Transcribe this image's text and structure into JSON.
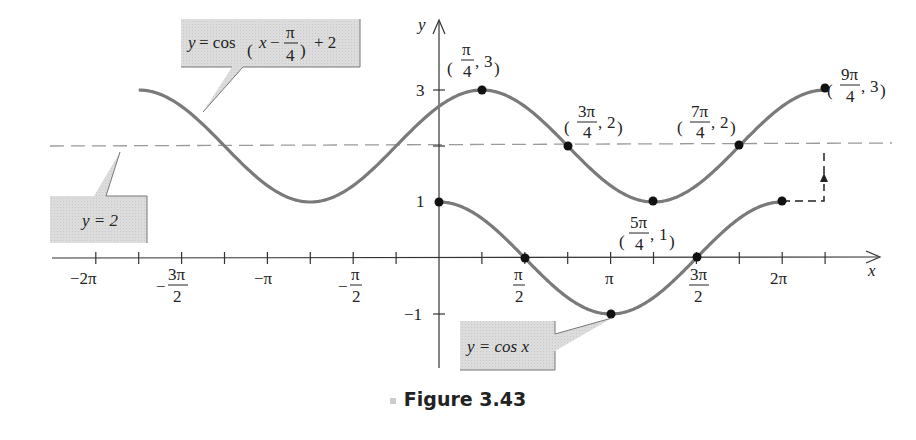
{
  "figure": {
    "caption": "Figure 3.43"
  },
  "chart_data": {
    "type": "line",
    "title": "",
    "xlabel": "x",
    "ylabel": "y",
    "xlim": [
      -6.6,
      8.4
    ],
    "ylim": [
      -1.9,
      3.6
    ],
    "grid": false,
    "x_ticks": [
      "-2π",
      "-3π/2",
      "-π",
      "-π/2",
      "π/2",
      "π",
      "3π/2",
      "2π"
    ],
    "x_tick_values": [
      -6.2832,
      -4.7124,
      -3.1416,
      -1.5708,
      1.5708,
      3.1416,
      4.7124,
      6.2832
    ],
    "x_minor_tick_step": "π/4",
    "y_ticks": [
      "-1",
      "1",
      "3"
    ],
    "y_tick_values": [
      -1,
      1,
      3
    ],
    "series": [
      {
        "name": "y = cos x",
        "function": "cos(x)",
        "domain": [
          0,
          6.2832
        ],
        "points": [
          {
            "x": 0,
            "y": 1
          },
          {
            "x": 1.5708,
            "y": 0
          },
          {
            "x": 3.1416,
            "y": -1
          },
          {
            "x": 4.7124,
            "y": 0
          },
          {
            "x": 6.2832,
            "y": 1
          }
        ]
      },
      {
        "name": "y = cos(x − π/4) + 2",
        "function": "cos(x - pi/4) + 2",
        "domain": [
          -5.4978,
          7.0686
        ],
        "points": [
          {
            "x": 0.7854,
            "y": 3,
            "label": "(π/4, 3)"
          },
          {
            "x": 2.3562,
            "y": 2,
            "label": "(3π/4, 2)"
          },
          {
            "x": 3.927,
            "y": 1,
            "label": "(5π/4, 1)"
          },
          {
            "x": 5.4978,
            "y": 2,
            "label": "(7π/4, 2)"
          },
          {
            "x": 7.0686,
            "y": 3,
            "label": "(9π/4, 3)"
          }
        ]
      },
      {
        "name": "y = 2",
        "function": "2",
        "style": "dashed",
        "domain": [
          -6.6,
          8.4
        ]
      }
    ],
    "annotations": [
      "y = cos(x − π/4) + 2",
      "y = 2",
      "y = cos x",
      "(π/4, 3)",
      "(3π/4, 2)",
      "(5π/4, 1)",
      "(7π/4, 2)",
      "(9π/4, 3)",
      "shift arrow from (2π, 1) right π/4 then up 2 to (9π/4, 3)"
    ]
  },
  "labels": {
    "axis_x": "x",
    "axis_y": "y",
    "callout_shifted": {
      "pre": "y = cos",
      "inner": "x −",
      "frac_num": "π",
      "frac_den": "4",
      "post": "+ 2"
    },
    "callout_midline": "y = 2",
    "callout_cos": "y = cos x",
    "ticks_x": {
      "m2pi": "−2π",
      "m3pi2_num": "3π",
      "m3pi2_den": "2",
      "mpi": "−π",
      "mpi2_num": "π",
      "mpi2_den": "2",
      "pi2_num": "π",
      "pi2_den": "2",
      "pi": "π",
      "3pi2_num": "3π",
      "3pi2_den": "2",
      "2pi": "2π"
    },
    "ticks_y": {
      "one": "1",
      "three": "3",
      "neg_one": "−1"
    },
    "points": {
      "p1": {
        "num": "π",
        "den": "4",
        "y": "3"
      },
      "p2": {
        "num": "3π",
        "den": "4",
        "y": "2"
      },
      "p3": {
        "num": "5π",
        "den": "4",
        "y": "1"
      },
      "p4": {
        "num": "7π",
        "den": "4",
        "y": "2"
      },
      "p5": {
        "num": "9π",
        "den": "4",
        "y": "3"
      }
    }
  },
  "colors": {
    "curve": "#7a7a7a",
    "axis": "#333333",
    "dashed": "#9a9a9a",
    "callout_fill": "#d9d9d9",
    "point": "#111111"
  }
}
